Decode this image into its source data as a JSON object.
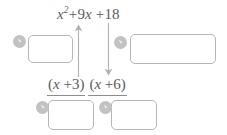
{
  "top_expression": {
    "name": "quadratic-expression",
    "full_text": "x^2 + 9x + 18",
    "variable": "x",
    "exponent": "2",
    "plus_1": "+",
    "middle_coefficient": "9",
    "middle_variable": "x",
    "plus_2": "+",
    "constant": "18"
  },
  "factors_expression": {
    "name": "factored-form",
    "full_text": "(x + 3)(x + 6)",
    "factor_1": {
      "open_paren": "(",
      "variable": "x",
      "operator": "+",
      "number": "3",
      "close_paren": ")"
    },
    "factor_2": {
      "open_paren": "(",
      "variable": "x",
      "operator": "+",
      "number": "6",
      "close_paren": ")"
    }
  },
  "answer_boxes": [
    {
      "id": "box-left",
      "value": "",
      "placeholder": ""
    },
    {
      "id": "box-right",
      "value": "",
      "placeholder": ""
    },
    {
      "id": "box-bottom-1",
      "value": "",
      "placeholder": ""
    },
    {
      "id": "box-bottom-2",
      "value": "",
      "placeholder": ""
    }
  ],
  "badges": [
    {
      "id": "badge-left",
      "icon": "arrow-pointer-badge-icon"
    },
    {
      "id": "badge-right",
      "icon": "arrow-pointer-badge-icon"
    },
    {
      "id": "badge-bottom-1",
      "icon": "arrow-pointer-badge-icon"
    },
    {
      "id": "badge-bottom-2",
      "icon": "arrow-pointer-badge-icon"
    }
  ],
  "arrows": [
    {
      "id": "arrow-up",
      "icon": "arrow-up-icon",
      "direction": "up"
    },
    {
      "id": "arrow-down",
      "icon": "arrow-down-icon",
      "direction": "down"
    }
  ],
  "colors": {
    "text": "#5b5b5b",
    "box_border": "#b6b6b6",
    "badge_fill": "#c2c2c2",
    "arrow": "#b0b0b0",
    "rule": "#8d8d8d",
    "background": "#ffffff"
  }
}
